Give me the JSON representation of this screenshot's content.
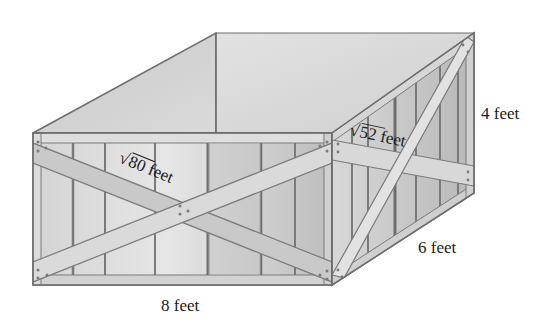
{
  "figure": {
    "colors": {
      "background": "#ffffff",
      "outline": "#6e6e6e",
      "interior_back": "#d9d9d9",
      "interior_left": "#cfcfcf",
      "front_panel": "#d6d6d6",
      "side_panel": "#c4c4c4",
      "brace": "#c8c8c8",
      "brace_light": "#e3e3e3",
      "slat_line": "#7a7a7a",
      "text": "#1a1a1a"
    },
    "labels": {
      "front_diagonal": "80 feet",
      "front_diagonal_radicand": "80",
      "side_diagonal": "52 feet",
      "side_diagonal_radicand": "52",
      "height": "4 feet",
      "depth": "6 feet",
      "length": "8 feet",
      "sqrt_symbol": "√"
    },
    "dimensions": {
      "length_ft": 8,
      "depth_ft": 6,
      "height_ft": 4,
      "front_diagonal": "√80 feet",
      "side_diagonal": "√52 feet"
    }
  }
}
